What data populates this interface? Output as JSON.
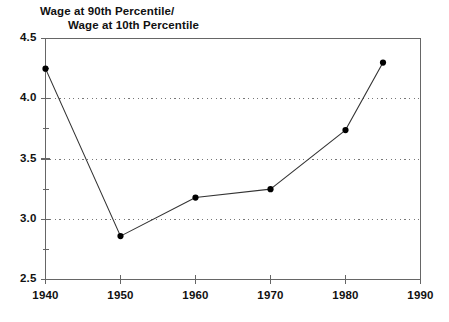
{
  "chart_data": {
    "type": "line",
    "title": "Wage at 90th Percentile/ Wage at 10th Percentile",
    "title_line_1": "Wage at 90th Percentile/",
    "title_line_2": "Wage at 10th Percentile",
    "xlabel": "",
    "ylabel": "",
    "xlim": [
      1940,
      1990
    ],
    "ylim": [
      2.5,
      4.5
    ],
    "xticks": [
      1940,
      1950,
      1960,
      1970,
      1980,
      1990
    ],
    "xtick_labels": [
      "1940",
      "1950",
      "1960",
      "1970",
      "1980",
      "1990"
    ],
    "yticks": [
      2.5,
      3.0,
      3.5,
      4.0,
      4.5
    ],
    "ytick_labels": [
      "2.5",
      "3.0",
      "3.5",
      "4.0",
      "4.5"
    ],
    "y_minor_ticks": [
      2.75,
      3.25,
      3.75,
      4.25
    ],
    "grid": true,
    "gridlines_y": [
      3.0,
      3.5,
      4.0
    ],
    "grid_style": "dotted",
    "legend": null,
    "marker": "filled-circle",
    "line_color": "#333333",
    "marker_color": "#000000",
    "x": [
      1940,
      1950,
      1960,
      1970,
      1980,
      1985
    ],
    "values": [
      4.25,
      2.86,
      3.18,
      3.25,
      3.74,
      4.3
    ],
    "series": [
      {
        "name": "Wage at 90th Percentile / Wage at 10th Percentile",
        "points": [
          {
            "x": 1940,
            "y": 4.25
          },
          {
            "x": 1950,
            "y": 2.86
          },
          {
            "x": 1960,
            "y": 3.18
          },
          {
            "x": 1970,
            "y": 3.25
          },
          {
            "x": 1980,
            "y": 3.74
          },
          {
            "x": 1985,
            "y": 4.3
          }
        ]
      }
    ]
  },
  "colors": {
    "axis": "#666666",
    "grid": "#777777",
    "line": "#333333",
    "marker": "#000000",
    "text": "#111111",
    "background": "#ffffff"
  }
}
